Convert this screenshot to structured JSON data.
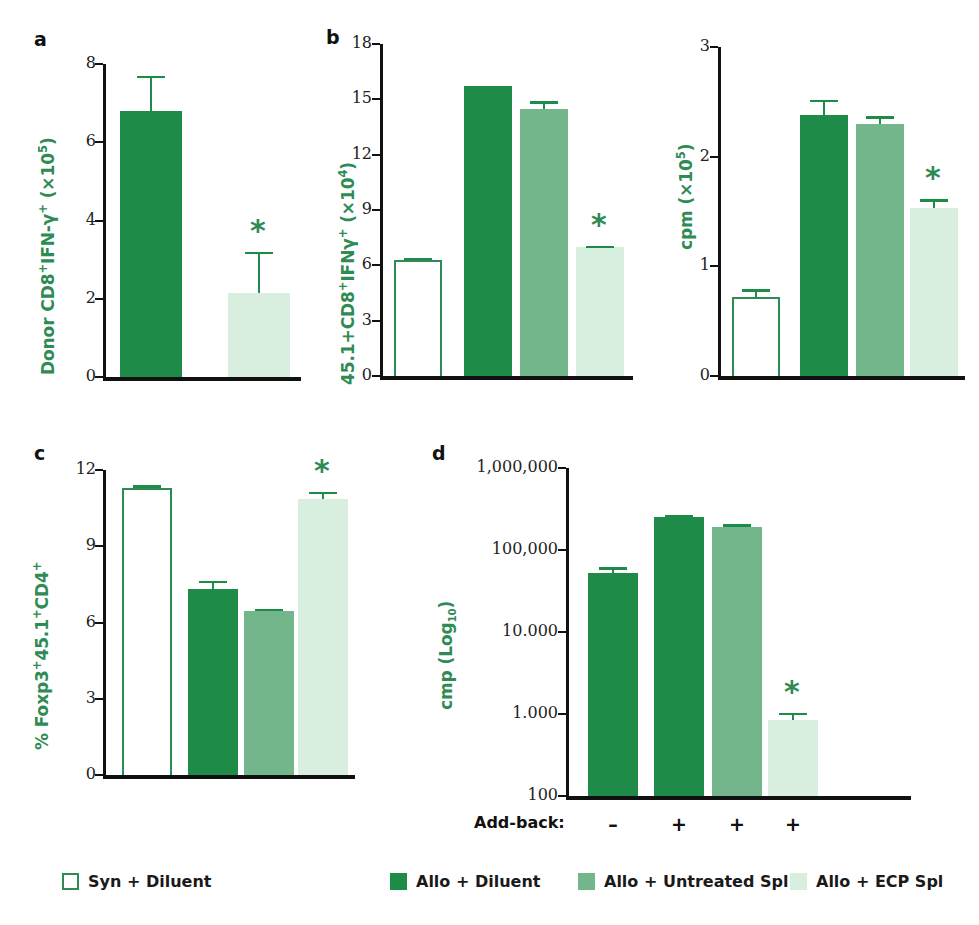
{
  "figure": {
    "background": "#ffffff",
    "accent_green": "#2E8B54",
    "colors": {
      "open": "#ffffff",
      "open_border": "#2E8B54",
      "dark": "#1E8B48",
      "medium": "#74B68C",
      "light": "#D8EEDF",
      "axis": "#111111"
    }
  },
  "panels": [
    {
      "letter": "a",
      "ylabel_html": "Donor CD8<sup>+</sup>IFN-γ<sup>+</sup> (×10<sup>5</sup>)",
      "ticks": [
        "8",
        "6",
        "4",
        "2",
        "0"
      ],
      "chart_data": {
        "type": "bar",
        "title": "a",
        "ylabel": "Donor CD8+IFN-γ+ (×10^5)",
        "xlabel": "",
        "ylim": [
          0,
          8
        ],
        "yticks": [
          0,
          2,
          4,
          6,
          8
        ],
        "grid": false,
        "legend": "bottom",
        "categories": [
          "Allo + Diluent",
          "Allo + ECP Spl"
        ],
        "styles": [
          "dark",
          "light"
        ],
        "values": [
          6.8,
          2.15
        ],
        "errors_upper": [
          7.7,
          3.2
        ],
        "errors_lower": [
          6.8,
          2.15
        ],
        "annotations": [
          {
            "category": "Allo + ECP Spl",
            "text": "*"
          }
        ]
      }
    },
    {
      "letter": "b",
      "ylabel_html": "45.1+CD8<sup>+</sup>IFNγ<sup>+</sup> (×10<sup>4</sup>)",
      "ticks": [
        "18",
        "15",
        "12",
        "9",
        "6",
        "3",
        "0"
      ],
      "chart_data": {
        "type": "bar",
        "title": "b",
        "ylabel": "45.1+CD8+IFNγ+ (×10^4)",
        "xlabel": "",
        "ylim": [
          0,
          18
        ],
        "yticks": [
          0,
          3,
          6,
          9,
          12,
          15,
          18
        ],
        "grid": false,
        "legend": "bottom",
        "categories": [
          "Syn + Diluent",
          "Allo + Diluent",
          "Allo + Untreated Spl",
          "Allo + ECP Spl"
        ],
        "styles": [
          "open",
          "dark",
          "medium",
          "light"
        ],
        "values": [
          6.3,
          15.7,
          14.5,
          7.0
        ],
        "errors_upper": [
          6.4,
          15.7,
          14.9,
          7.05
        ],
        "errors_lower": [
          6.2,
          15.7,
          14.1,
          6.95
        ],
        "annotations": [
          {
            "category": "Allo + ECP Spl",
            "text": "*"
          }
        ]
      }
    },
    {
      "letter": "",
      "ylabel_html": "cpm (×10<sup>5</sup>)",
      "ticks": [
        "3",
        "2",
        "1",
        "0"
      ],
      "chart_data": {
        "type": "bar",
        "title": "",
        "ylabel": "cpm (×10^5)",
        "xlabel": "",
        "ylim": [
          0,
          3
        ],
        "yticks": [
          0,
          1,
          2,
          3
        ],
        "grid": false,
        "legend": "bottom",
        "categories": [
          "Syn + Diluent",
          "Allo + Diluent",
          "Allo + Untreated Spl",
          "Allo + ECP Spl"
        ],
        "styles": [
          "open",
          "dark",
          "medium",
          "light"
        ],
        "values": [
          0.72,
          2.38,
          2.3,
          1.53
        ],
        "errors_upper": [
          0.79,
          2.52,
          2.37,
          1.61
        ],
        "errors_lower": [
          0.65,
          2.24,
          2.23,
          1.45
        ],
        "annotations": [
          {
            "category": "Allo + ECP Spl",
            "text": "*"
          }
        ]
      }
    },
    {
      "letter": "c",
      "ylabel_html": "% Foxp3<sup>+</sup>45.1<sup>+</sup>CD4<sup>+</sup>",
      "ticks": [
        "12",
        "9",
        "6",
        "3",
        "0"
      ],
      "chart_data": {
        "type": "bar",
        "title": "c",
        "ylabel": "% Foxp3+45.1+CD4+",
        "xlabel": "",
        "ylim": [
          0,
          12
        ],
        "yticks": [
          0,
          3,
          6,
          9,
          12
        ],
        "grid": false,
        "legend": "bottom",
        "categories": [
          "Syn + Diluent",
          "Allo + Diluent",
          "Allo + Untreated Spl",
          "Allo + ECP Spl"
        ],
        "styles": [
          "open",
          "dark",
          "medium",
          "light"
        ],
        "values": [
          11.3,
          7.3,
          6.45,
          10.85
        ],
        "errors_upper": [
          11.4,
          7.65,
          6.55,
          11.15
        ],
        "errors_lower": [
          11.2,
          6.95,
          6.35,
          10.55
        ],
        "annotations": [
          {
            "category": "Allo + ECP Spl",
            "text": "*"
          }
        ]
      }
    },
    {
      "letter": "d",
      "ylabel_html": "cmp (Log<sub>10</sub>)",
      "ticks": [
        "1,000,000",
        "100,000",
        "10.000",
        "1.000",
        "100"
      ],
      "chart_data": {
        "type": "bar",
        "title": "d",
        "ylabel": "cmp (Log10)",
        "xlabel": "",
        "yscale": "log",
        "ylim": [
          100,
          1000000
        ],
        "ytick_labels": [
          "1,000,000",
          "100,000",
          "10.000",
          "1.000",
          "100"
        ],
        "ytick_values": [
          1000000,
          100000,
          10000,
          1000,
          100
        ],
        "grid": false,
        "legend": "bottom",
        "categories": [
          "Allo + Diluent",
          "Allo + Diluent",
          "Allo + Untreated Spl",
          "Allo + ECP Spl"
        ],
        "styles": [
          "dark",
          "dark",
          "medium",
          "light"
        ],
        "values": [
          52000,
          250000,
          190000,
          850
        ],
        "errors_upper": [
          62000,
          270000,
          205000,
          1030
        ],
        "errors_lower": [
          44000,
          232000,
          176000,
          700
        ],
        "annotations": [
          {
            "category": "Allo + ECP Spl",
            "text": "*"
          }
        ]
      }
    }
  ],
  "addback": {
    "label": "Add-back:",
    "values": [
      "–",
      "+",
      "+",
      "+"
    ]
  },
  "legend": {
    "items": [
      {
        "label": "Syn + Diluent",
        "style": "open",
        "swatch_color": "#ffffff",
        "swatch_border": "#2E8B54"
      },
      {
        "label": "Allo + Diluent",
        "style": "dark",
        "swatch_color": "#1E8B48",
        "swatch_border": "#1E8B48"
      },
      {
        "label": "Allo + Untreated Spl",
        "style": "medium",
        "swatch_color": "#74B68C",
        "swatch_border": "#74B68C"
      },
      {
        "label": "Allo + ECP Spl",
        "style": "light",
        "swatch_color": "#D8EEDF",
        "swatch_border": "#D8EEDF"
      }
    ]
  }
}
